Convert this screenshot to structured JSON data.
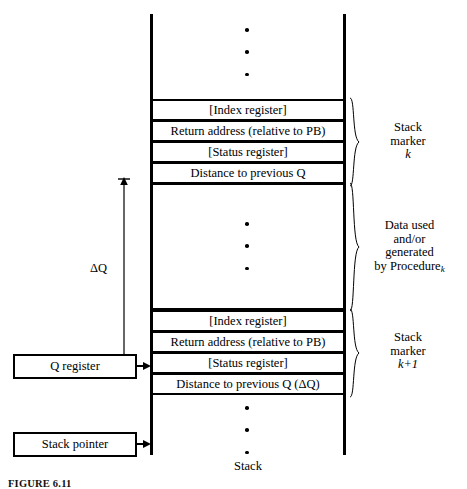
{
  "figure": {
    "stack_label": "Stack",
    "caption": "FIGURE 6.11",
    "delta_q_label": "ΔQ"
  },
  "stack": {
    "marker_k": {
      "rows": [
        "[Index register]",
        "Return address (relative to PB)",
        "[Status register]",
        "Distance to previous Q"
      ],
      "brace_label_line1": "Stack",
      "brace_label_line2": "marker",
      "brace_label_line3": "k"
    },
    "data_area": {
      "brace_label_line1": "Data used",
      "brace_label_line2": "and/or",
      "brace_label_line3": "generated",
      "brace_label_line4": "by Procedure",
      "brace_label_sub": "k"
    },
    "marker_k1": {
      "rows": [
        "[Index register]",
        "Return address (relative to PB)",
        "[Status register]",
        "Distance to previous Q  (ΔQ)"
      ],
      "brace_label_line1": "Stack",
      "brace_label_line2": "marker",
      "brace_label_line3": "k+1"
    }
  },
  "registers": {
    "q_register": "Q register",
    "stack_pointer": "Stack pointer"
  },
  "colors": {
    "ink": "#000000",
    "paper": "#ffffff"
  }
}
